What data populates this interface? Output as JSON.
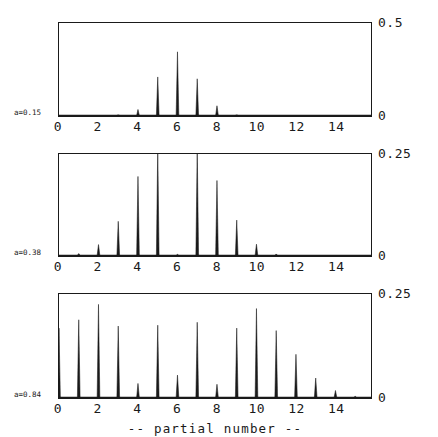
{
  "figure": {
    "xaxis_title": "-- partial number --",
    "x_tick_labels": [
      "0",
      "2",
      "4",
      "6",
      "8",
      "10",
      "12",
      "14"
    ],
    "x_tick_values": [
      0,
      2,
      4,
      6,
      8,
      10,
      12,
      14
    ],
    "axis_color": "#1a1a1a",
    "background": "#ffffff"
  },
  "panels": [
    {
      "side_label": "a=0.15",
      "ytop_label": "0.5",
      "ybot_label": "0"
    },
    {
      "side_label": "a=0.38",
      "ytop_label": "0.25",
      "ybot_label": "0"
    },
    {
      "side_label": "a=0.84",
      "ytop_label": "0.25",
      "ybot_label": "0"
    }
  ],
  "chart_data": [
    {
      "type": "bar",
      "title": "",
      "subtitle": "a=0.15",
      "xlabel": "-- partial number --",
      "ylabel": "",
      "xlim": [
        0,
        15.8
      ],
      "ylim": [
        0,
        0.5
      ],
      "grid": false,
      "legend": null,
      "xticks": [
        0,
        2,
        4,
        6,
        8,
        10,
        12,
        14
      ],
      "yticks": [
        0,
        0.5
      ],
      "ytick_labels": [
        "0",
        "0.5"
      ],
      "categories": [
        0,
        1,
        2,
        3,
        4,
        5,
        6,
        7,
        8,
        9,
        10,
        11,
        12,
        13,
        14,
        15
      ],
      "values": [
        0.0,
        0.0,
        0.0,
        0.006,
        0.035,
        0.21,
        0.345,
        0.2,
        0.055,
        0.006,
        0.0,
        0.0,
        0.0,
        0.0,
        0.0,
        0.0
      ]
    },
    {
      "type": "bar",
      "title": "",
      "subtitle": "a=0.38",
      "xlabel": "-- partial number --",
      "ylabel": "",
      "xlim": [
        0,
        15.8
      ],
      "ylim": [
        0,
        0.25
      ],
      "grid": false,
      "legend": null,
      "xticks": [
        0,
        2,
        4,
        6,
        8,
        10,
        12,
        14
      ],
      "yticks": [
        0,
        0.25
      ],
      "ytick_labels": [
        "0",
        "0.25"
      ],
      "categories": [
        0,
        1,
        2,
        3,
        4,
        5,
        6,
        7,
        8,
        9,
        10,
        11,
        12,
        13,
        14,
        15
      ],
      "values": [
        0.0,
        0.006,
        0.028,
        0.085,
        0.195,
        0.27,
        0.004,
        0.27,
        0.185,
        0.088,
        0.029,
        0.005,
        0.0,
        0.0,
        0.0,
        0.0
      ],
      "annotations": [
        {
          "note": "peaks at 5 and 7 are clipped at the top of the frame (exceed 0.25)"
        }
      ]
    },
    {
      "type": "bar",
      "title": "",
      "subtitle": "a=0.84",
      "xlabel": "-- partial number --",
      "ylabel": "",
      "xlim": [
        0,
        15.8
      ],
      "ylim": [
        0,
        0.25
      ],
      "grid": false,
      "legend": null,
      "xticks": [
        0,
        2,
        4,
        6,
        8,
        10,
        12,
        14
      ],
      "yticks": [
        0,
        0.25
      ],
      "ytick_labels": [
        "0",
        "0.25"
      ],
      "categories": [
        0,
        1,
        2,
        3,
        4,
        5,
        6,
        7,
        8,
        9,
        10,
        11,
        12,
        13,
        14,
        15
      ],
      "values": [
        0.168,
        0.188,
        0.225,
        0.173,
        0.035,
        0.175,
        0.055,
        0.182,
        0.033,
        0.168,
        0.215,
        0.162,
        0.105,
        0.048,
        0.018,
        0.004
      ]
    }
  ]
}
